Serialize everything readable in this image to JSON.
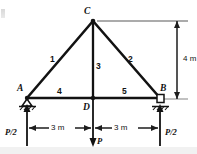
{
  "figure": {
    "type": "truss-diagram",
    "nodes": [
      {
        "id": "A",
        "label": "A",
        "x": 27,
        "y": 98,
        "support": "pin"
      },
      {
        "id": "B",
        "label": "B",
        "x": 160,
        "y": 98,
        "support": "roller"
      },
      {
        "id": "C",
        "label": "C",
        "x": 93,
        "y": 21,
        "support": "none"
      },
      {
        "id": "D",
        "label": "D",
        "x": 93,
        "y": 98,
        "support": "none"
      }
    ],
    "members": [
      {
        "label": "1",
        "from": "A",
        "to": "C"
      },
      {
        "label": "2",
        "from": "C",
        "to": "B"
      },
      {
        "label": "3",
        "from": "C",
        "to": "D"
      },
      {
        "label": "4",
        "from": "A",
        "to": "D"
      },
      {
        "label": "5",
        "from": "D",
        "to": "B"
      }
    ],
    "dimensions": [
      {
        "id": "height",
        "label": "4 m",
        "orientation": "vertical"
      },
      {
        "id": "span-left",
        "label": "3 m",
        "orientation": "horizontal"
      },
      {
        "id": "span-right",
        "label": "3 m",
        "orientation": "horizontal"
      }
    ],
    "forces": [
      {
        "id": "reaction-left",
        "label": "P/2",
        "direction": "up",
        "at": "A"
      },
      {
        "id": "applied-load",
        "label": "P",
        "direction": "down",
        "at": "D"
      },
      {
        "id": "reaction-right",
        "label": "P/2",
        "direction": "up",
        "at": "B"
      }
    ],
    "colors": {
      "line": "#121212",
      "dimension": "#3a3a3a",
      "leader": "#8a8a8a",
      "background": "#ffffff",
      "band": "#f1f1f1"
    }
  }
}
